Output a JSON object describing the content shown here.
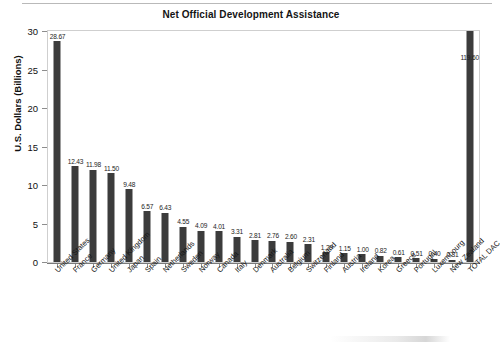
{
  "chart_data": {
    "type": "bar",
    "title": "Net Official Development Assistance",
    "xlabel": "",
    "ylabel": "U.S. Dollars (Billions)",
    "ylim": [
      0,
      30
    ],
    "ytick_step": 5,
    "ytick_labels": [
      "0",
      "5",
      "10",
      "15",
      "20",
      "25",
      "30"
    ],
    "grid": false,
    "legend": null,
    "bar_color": "#3c3c3c",
    "note": "TOTAL DAC bar value 119.60 exceeds the axis maximum and is drawn clipped at the top of the plot area",
    "categories": [
      "United States",
      "France",
      "Germany",
      "United Kingdom",
      "Japan",
      "Spain",
      "Netherlands",
      "Sweden",
      "Norway",
      "Canada",
      "Italy",
      "Denmark",
      "Australia",
      "Belgium",
      "Switzerland",
      "Finland",
      "Austria",
      "Ireland",
      "Korea",
      "Greece",
      "Portugal",
      "Luxembourg",
      "New Zealand",
      "TOTAL DAC"
    ],
    "values": [
      28.67,
      12.43,
      11.98,
      11.5,
      9.48,
      6.57,
      6.43,
      4.55,
      4.09,
      4.01,
      3.31,
      2.81,
      2.76,
      2.6,
      2.31,
      1.29,
      1.15,
      1.0,
      0.82,
      0.61,
      0.51,
      0.4,
      0.31,
      119.6
    ],
    "value_labels": [
      "28.67",
      "12.43",
      "11.98",
      "11.50",
      "9.48",
      "6.57",
      "6.43",
      "4.55",
      "4.09",
      "4.01",
      "3.31",
      "2.81",
      "2.76",
      "2.60",
      "2.31",
      "1.29",
      "1.15",
      "1.00",
      "0.82",
      "0.61",
      "0.51",
      "0.40",
      "0.31",
      "119.60"
    ]
  }
}
